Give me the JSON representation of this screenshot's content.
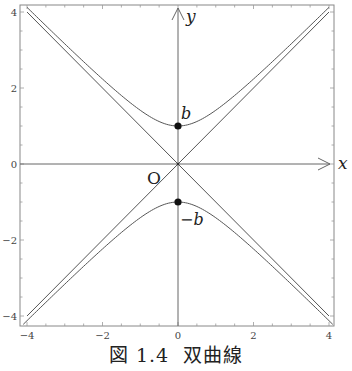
{
  "figure": {
    "caption_number": "図 1.4",
    "caption_title": "双曲線"
  },
  "labels": {
    "x_axis": "x",
    "y_axis": "y",
    "origin": "O",
    "vertex_top": "b",
    "vertex_bottom": "−b"
  },
  "chart_data": {
    "type": "line",
    "title": "双曲線",
    "xlabel": "x",
    "ylabel": "y",
    "xlim": [
      -4,
      4
    ],
    "ylim": [
      -4,
      4
    ],
    "x_ticks": [
      -4,
      -2,
      0,
      2,
      4
    ],
    "y_ticks": [
      -4,
      -2,
      0,
      2,
      4
    ],
    "minor_tick_step": 0.5,
    "grid": false,
    "equation": "y^2/b^2 - x^2/a^2 = 1 (a = b = 1)",
    "series": [
      {
        "name": "upper branch y = sqrt(1 + x^2)",
        "x": [
          -4,
          -3,
          -2,
          -1,
          0,
          1,
          2,
          3,
          4
        ],
        "y": [
          4.123,
          3.162,
          2.236,
          1.414,
          1.0,
          1.414,
          2.236,
          3.162,
          4.123
        ]
      },
      {
        "name": "lower branch y = -sqrt(1 + x^2)",
        "x": [
          -4,
          -3,
          -2,
          -1,
          0,
          1,
          2,
          3,
          4
        ],
        "y": [
          -4.123,
          -3.162,
          -2.236,
          -1.414,
          -1.0,
          -1.414,
          -2.236,
          -3.162,
          -4.123
        ]
      },
      {
        "name": "asymptote y = x",
        "x": [
          -4,
          4
        ],
        "y": [
          -4,
          4
        ]
      },
      {
        "name": "asymptote y = -x",
        "x": [
          -4,
          4
        ],
        "y": [
          4,
          -4
        ]
      }
    ],
    "points": [
      {
        "label": "b",
        "x": 0,
        "y": 1
      },
      {
        "label": "−b",
        "x": 0,
        "y": -1
      }
    ],
    "annotations": [
      "O",
      "b",
      "−b",
      "x",
      "y"
    ]
  },
  "colors": {
    "curve": "#555555",
    "axis": "#666666",
    "frame": "#888888",
    "point": "#111111",
    "text": "#222222"
  }
}
